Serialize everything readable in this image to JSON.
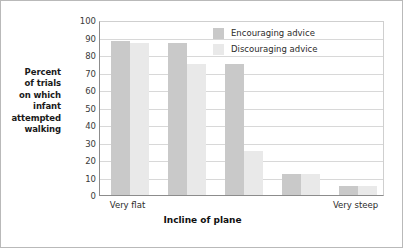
{
  "chart_data": {
    "type": "bar",
    "title": "",
    "subtitle": "",
    "xlabel": "Incline of plane",
    "ylabel": "Percent of trials on which infant attempted walking",
    "ylabel_lines": [
      "Percent",
      "of trials",
      "on which",
      "infant",
      "attempted",
      "walking"
    ],
    "categories": [
      "Very flat",
      "",
      "",
      "",
      "Very steep"
    ],
    "visible_tick_labels": [
      {
        "index": 0,
        "label": "Very flat"
      },
      {
        "index": 4,
        "label": "Very steep"
      }
    ],
    "series": [
      {
        "name": "Encouraging advice",
        "color": "#c9c9c9",
        "values": [
          88,
          87,
          75,
          12,
          5
        ]
      },
      {
        "name": "Discouraging advice",
        "color": "#e9e9e9",
        "values": [
          87,
          75,
          25,
          12,
          5
        ]
      }
    ],
    "ylim": [
      0,
      100
    ],
    "ytick_values": [
      0,
      10,
      20,
      30,
      40,
      50,
      60,
      70,
      80,
      90,
      100
    ],
    "ytick_labels": [
      "0",
      "10",
      "20",
      "30",
      "40",
      "50",
      "60",
      "70",
      "80",
      "90",
      "100"
    ],
    "grid": true,
    "grid_axis": "y",
    "legend_position": "top-right"
  },
  "legend": {
    "entries": [
      {
        "label": "Encouraging advice",
        "swatch_name": "legend-swatch-encouraging"
      },
      {
        "label": "Discouraging advice",
        "swatch_name": "legend-swatch-discouraging"
      }
    ]
  },
  "colors": {
    "encouraging": "#c9c9c9",
    "discouraging": "#e9e9e9",
    "axis": "#8c8c8c",
    "grid": "#d8d8d8",
    "frame": "#b9b9b9",
    "text": "#2b2b2b"
  }
}
